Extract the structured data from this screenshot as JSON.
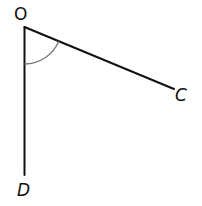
{
  "diagram": {
    "type": "angle",
    "points": {
      "O": {
        "label": "O",
        "x": 24.5,
        "y": 27
      },
      "C": {
        "label": "C",
        "x": 174,
        "y": 89
      },
      "D": {
        "label": "D",
        "x": 24.5,
        "y": 175
      }
    },
    "segments": [
      {
        "from": "O",
        "to": "C"
      },
      {
        "from": "O",
        "to": "D"
      }
    ],
    "angle_marker": {
      "vertex": "O",
      "between": [
        "D",
        "C"
      ],
      "radius": 37
    },
    "colors": {
      "line": "#111111",
      "arc": "#777777",
      "background": "#ffffff"
    }
  }
}
